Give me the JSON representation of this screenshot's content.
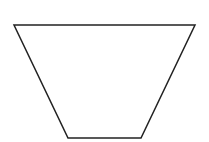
{
  "diagram": {
    "shape": "trapezoid",
    "orientation": "inverted",
    "stroke_color": "#222222",
    "fill_color": "#ffffff",
    "stroke_width": 1.5,
    "points": "14,25 195,25 141,138 68,138"
  }
}
